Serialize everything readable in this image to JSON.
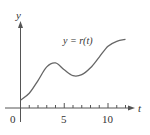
{
  "chart_data": {
    "type": "line",
    "title": "",
    "annotation": "y = r(t)",
    "xlabel": "t",
    "ylabel": "y",
    "x_ticks": [
      "0",
      "5",
      "10"
    ],
    "xlim": [
      0,
      12
    ],
    "grid": false,
    "series": [
      {
        "name": "r(t)",
        "x": [
          0,
          1,
          2,
          3,
          4,
          5,
          6,
          7,
          8,
          9,
          10,
          11,
          12
        ],
        "values": [
          0.8,
          1.5,
          2.8,
          4.2,
          4.6,
          3.9,
          3.3,
          3.4,
          4.1,
          5.2,
          6.3,
          6.8,
          7.0
        ]
      }
    ]
  },
  "labels": {
    "y_axis": "y",
    "x_axis": "t",
    "origin": "0",
    "tick5": "5",
    "tick10": "10",
    "curve": "y = r(t)"
  },
  "colors": {
    "axis": "#555555",
    "curve": "#666666"
  }
}
